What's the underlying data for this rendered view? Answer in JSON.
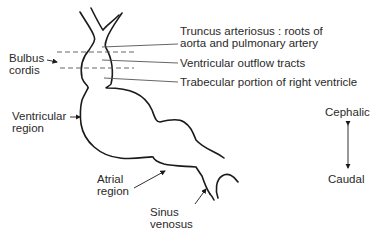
{
  "diagram": {
    "type": "embryonic heart tube",
    "labels": {
      "bulbus_cordis": [
        "Bulbus",
        "cordis"
      ],
      "ventricular_region": [
        "Ventricular",
        "region"
      ],
      "atrial_region": [
        "Atrial",
        "region"
      ],
      "sinus_venosus": [
        "Sinus",
        "venosus"
      ],
      "truncus": [
        "Truncus arteriosus : roots of",
        "aorta and pulmonary artery"
      ],
      "outflow": "Ventricular outflow tracts",
      "trabecular": "Trabecular portion of right ventricle"
    },
    "orientation": {
      "top": "Cephalic",
      "bottom": "Caudal"
    },
    "colors": {
      "line": "#1a1a1a",
      "text": "#2a2a2a",
      "leader": "#555555"
    }
  }
}
